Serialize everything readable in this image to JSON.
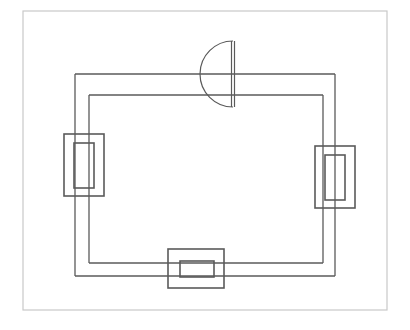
{
  "document": {
    "type": "architectural-floor-plan",
    "title": "",
    "background_color": "#ffffff",
    "line_color": "#4a4a4a",
    "frame_color": "#c9c9c9",
    "wall_color": "#555555",
    "detail_color": "#5a5a5a"
  },
  "frame": {
    "name": "sheet-border",
    "x": 23,
    "y": 11,
    "width": 364,
    "height": 299,
    "stroke": "#c9c9c9",
    "stroke_width": 1.2,
    "fill": "none"
  },
  "plan": {
    "outer_wall": {
      "name": "outer-wall-outline",
      "left": 75,
      "right": 335,
      "top": 74,
      "bottom": 276,
      "stroke": "#5a5a5a",
      "stroke_width": 1.3
    },
    "inner_wall": {
      "name": "inner-wall-outline",
      "left": 89,
      "right": 323,
      "top": 95,
      "bottom": 263,
      "stroke": "#5a5a5a",
      "stroke_width": 1.3
    },
    "apse": {
      "name": "north-apse",
      "center_x": 233,
      "center_y": 74,
      "chord_x": 233,
      "top_y": 41,
      "bottom_y": 107,
      "radius": 33,
      "inner_chord_x": 230,
      "stroke": "#5a5a5a",
      "stroke_width": 1.2,
      "orientation": "opens-left",
      "wall_junction_top_y": 74,
      "wall_junction_bottom_y": 95
    },
    "west_window": {
      "name": "west-window-bay",
      "outer": {
        "x": 64,
        "y": 134,
        "width": 40,
        "height": 62
      },
      "inner": {
        "x": 74,
        "y": 143,
        "width": 20,
        "height": 45
      },
      "stroke": "#5a5a5a",
      "stroke_width": 1.6
    },
    "east_window": {
      "name": "east-window-bay",
      "outer": {
        "x": 315,
        "y": 146,
        "width": 40,
        "height": 62
      },
      "inner": {
        "x": 325,
        "y": 155,
        "width": 20,
        "height": 45
      },
      "stroke": "#5a5a5a",
      "stroke_width": 1.6
    },
    "south_portal": {
      "name": "south-entrance-portal",
      "outer": {
        "x": 168,
        "y": 249,
        "width": 56,
        "height": 39
      },
      "inner": {
        "x": 180,
        "y": 261,
        "width": 34,
        "height": 16
      },
      "stroke": "#5a5a5a",
      "stroke_width": 1.6
    }
  },
  "features": [
    {
      "id": "apse",
      "label": "Semicircular apse (north)"
    },
    {
      "id": "west-window",
      "label": "West window bay"
    },
    {
      "id": "east-window",
      "label": "East window bay"
    },
    {
      "id": "south-portal",
      "label": "South entrance portal"
    },
    {
      "id": "double-wall",
      "label": "Double-line perimeter wall"
    }
  ]
}
